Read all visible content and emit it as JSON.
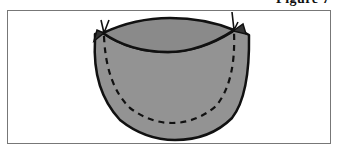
{
  "figure": {
    "label": "Figure 7",
    "colors": {
      "body_fill": "#939393",
      "inner_fill": "#8a8a8a",
      "outline": "#111111",
      "frame": "#777777",
      "background": "#ffffff"
    },
    "parts": [
      {
        "name": "bowl-body",
        "shape": "half-ellipse"
      },
      {
        "name": "rim-opening",
        "shape": "lens"
      },
      {
        "name": "fold-line",
        "style": "dashed"
      },
      {
        "name": "left-tie",
        "shape": "v-mark"
      },
      {
        "name": "right-tie",
        "shape": "v-mark"
      }
    ]
  }
}
